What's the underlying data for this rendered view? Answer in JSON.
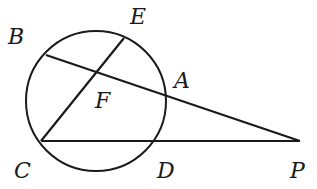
{
  "diagram": {
    "type": "geometry",
    "circle": {
      "cx": 96,
      "cy": 101,
      "r": 70
    },
    "points": {
      "B": {
        "x": 46,
        "y": 55,
        "label": "B",
        "lx": 8,
        "ly": 44
      },
      "E": {
        "x": 124,
        "y": 38,
        "label": "E",
        "lx": 130,
        "ly": 24
      },
      "A": {
        "x": 165,
        "y": 95,
        "label": "A",
        "lx": 174,
        "ly": 88
      },
      "F": {
        "x": 97,
        "y": 73,
        "label": "F",
        "lx": 95,
        "ly": 108
      },
      "C": {
        "x": 41,
        "y": 141,
        "label": "C",
        "lx": 14,
        "ly": 178
      },
      "D": {
        "x": 153,
        "y": 141,
        "label": "D",
        "lx": 157,
        "ly": 178
      },
      "P": {
        "x": 300,
        "y": 141,
        "label": "P",
        "lx": 290,
        "ly": 178
      }
    },
    "segments": [
      {
        "name": "BP",
        "from": "B",
        "to": "P"
      },
      {
        "name": "CE",
        "from": "C",
        "to": "E"
      },
      {
        "name": "CP",
        "from": "C",
        "to": "P"
      }
    ],
    "stroke_color": "#1a1a1a"
  }
}
